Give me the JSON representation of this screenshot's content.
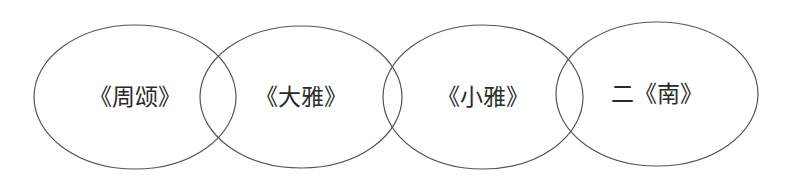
{
  "diagram": {
    "type": "overlapping-ellipses",
    "stroke_color": "#555555",
    "background": "#ffffff",
    "ellipses": [
      {
        "label": "《周颂》",
        "cx": 135,
        "cy": 97,
        "rx": 101,
        "ry": 72
      },
      {
        "label": "《大雅》",
        "cx": 301,
        "cy": 97,
        "rx": 101,
        "ry": 71
      },
      {
        "label": "《小雅》",
        "cx": 483,
        "cy": 97,
        "rx": 100,
        "ry": 72
      },
      {
        "label": "二《南》",
        "cx": 657,
        "cy": 94,
        "rx": 101,
        "ry": 72
      }
    ]
  }
}
